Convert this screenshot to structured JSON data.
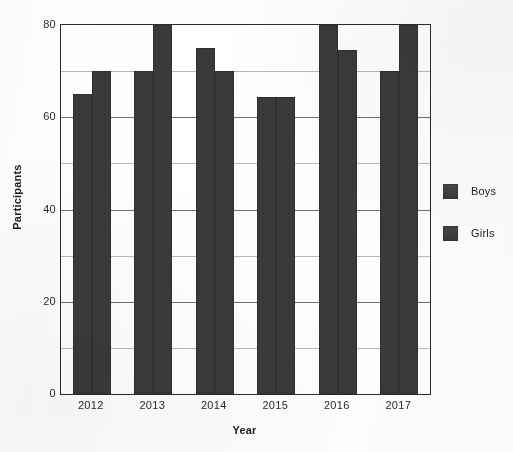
{
  "chart_data": {
    "type": "bar",
    "title": "",
    "subtitle": "",
    "xlabel": "Year",
    "ylabel": "Participants",
    "categories": [
      "2012",
      "2013",
      "2014",
      "2015",
      "2016",
      "2017"
    ],
    "series": [
      {
        "name": "Boys",
        "color": "#3a3a3a",
        "values": [
          65,
          70,
          75,
          64.5,
          80,
          70
        ]
      },
      {
        "name": "Girls",
        "color": "#3a3a3a",
        "values": [
          70,
          80,
          70,
          64.5,
          74.5,
          80
        ]
      }
    ],
    "ylim": [
      0,
      80
    ],
    "yticks": [
      0,
      20,
      40,
      60,
      80
    ],
    "ytick_labels": [
      "0",
      "20",
      "40",
      "60",
      "80"
    ],
    "gridlines": [
      10,
      20,
      30,
      40,
      50,
      60,
      70
    ],
    "grid": true,
    "legend_position": "right",
    "bar_group_gap_ratio": 0.38
  },
  "legend": {
    "items": [
      {
        "label": "Boys",
        "swatch": "legend-swatch-boys"
      },
      {
        "label": "Girls",
        "swatch": "legend-swatch-girls"
      }
    ]
  },
  "axes": {
    "y_title": "Participants",
    "x_title": "Year",
    "y_tick_labels": [
      "80",
      "60",
      "40",
      "20",
      "0"
    ],
    "x_tick_labels": [
      "2012",
      "2013",
      "2014",
      "2015",
      "2016",
      "2017"
    ]
  },
  "colors": {
    "bar": "#3a3a3a",
    "axis": "#2b2b2b",
    "grid_major": "#6f6f6f",
    "grid_minor": "#b9b9b9",
    "text": "#1c1c1c",
    "background": "#ffffff"
  }
}
